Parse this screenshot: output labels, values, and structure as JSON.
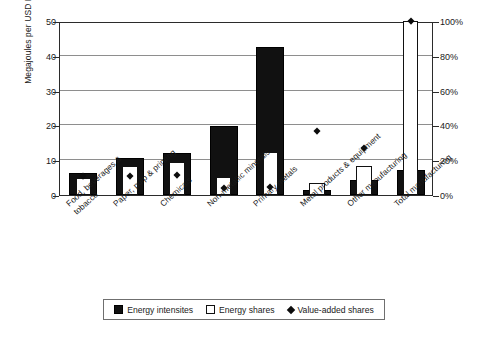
{
  "chart_data": {
    "type": "bar",
    "title": "",
    "subtitle": "",
    "xlabel": "",
    "ylabel": "Megajoules per USD PPP 2000",
    "y2label": "",
    "ylim": [
      0,
      50
    ],
    "y2lim": [
      0,
      100
    ],
    "yticks": [
      0,
      10,
      20,
      30,
      40,
      50
    ],
    "yticklabels": [
      "0",
      "10",
      "20",
      "30",
      "40",
      "50"
    ],
    "y2ticks": [
      0,
      20,
      40,
      60,
      80,
      100
    ],
    "y2ticklabels": [
      "0%",
      "20%",
      "40%",
      "60%",
      "80%",
      "100%"
    ],
    "grid": true,
    "legend_position": "bottom",
    "categories": [
      "Food, beverages & tobacco",
      "Paper, pulp & printing",
      "Chemicals",
      "Non-metallic minerals",
      "Primary metals",
      "Metal products & equipment",
      "Other manufacturing",
      "Total manufacturing"
    ],
    "category_lines": [
      [
        "Food, beverages &",
        "tobacco"
      ],
      [
        "Paper, pulp & printing"
      ],
      [
        "Chemicals"
      ],
      [
        "Non-metallic minerals"
      ],
      [
        "Primary metals"
      ],
      [
        "Metal products & equipment"
      ],
      [
        "Other manufacturing"
      ],
      [
        "Total manufacturing"
      ]
    ],
    "series": [
      {
        "name": "Energy intensites",
        "kind": "bar",
        "axis": "left",
        "unit": "MJ per USD PPP 2000",
        "color": "#111111",
        "values": [
          6.2,
          10.7,
          12.0,
          19.8,
          42.4,
          1.5,
          4.2,
          7.1
        ]
      },
      {
        "name": "Energy shares",
        "kind": "bar",
        "axis": "right",
        "unit": "%",
        "color": "#ffffff",
        "values": [
          10.0,
          16.5,
          19.0,
          10.5,
          25.0,
          7.0,
          16.5,
          100.0
        ]
      },
      {
        "name": "Value-added shares",
        "kind": "marker",
        "axis": "right",
        "unit": "%",
        "color": "#0c0c0c",
        "values": [
          10.5,
          10.5,
          11.0,
          4.0,
          4.5,
          36.5,
          27.0,
          100.0
        ]
      }
    ]
  },
  "legend": {
    "items": [
      {
        "label": "Energy intensites",
        "marker": "filled-square-icon"
      },
      {
        "label": "Energy shares",
        "marker": "open-square-icon"
      },
      {
        "label": "Value-added shares",
        "marker": "filled-diamond-icon"
      }
    ]
  }
}
